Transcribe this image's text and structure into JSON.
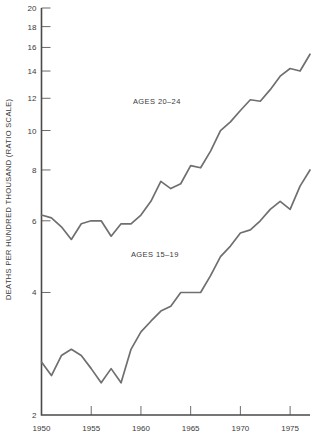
{
  "chart_data": {
    "type": "line",
    "title": "",
    "xlabel": "",
    "ylabel": "DEATHS PER HUNDRED THOUSAND (RATIO SCALE)",
    "scale": "log",
    "grid": false,
    "legend": "inline-annotations",
    "xlim": [
      1950,
      1977
    ],
    "ylim": [
      2,
      20
    ],
    "ytick_values": [
      2,
      4,
      6,
      8,
      10,
      12,
      14,
      16,
      18,
      20
    ],
    "ytick_labels": [
      "2",
      "4",
      "6",
      "8",
      "10",
      "12",
      "14",
      "16",
      "18",
      "20"
    ],
    "xtick_values": [
      1950,
      1955,
      1960,
      1965,
      1970,
      1975
    ],
    "xtick_labels": [
      "1950",
      "1955",
      "1960",
      "1965",
      "1970",
      "1975"
    ],
    "x": [
      1950,
      1951,
      1952,
      1953,
      1954,
      1955,
      1956,
      1957,
      1958,
      1959,
      1960,
      1961,
      1962,
      1963,
      1964,
      1965,
      1966,
      1967,
      1968,
      1969,
      1970,
      1971,
      1972,
      1973,
      1974,
      1975,
      1976,
      1977
    ],
    "series": [
      {
        "name": "AGES 20-24",
        "label": "AGES 20–24",
        "label_x": 1961.6,
        "label_y": 11.6,
        "values": [
          6.2,
          6.1,
          5.8,
          5.4,
          5.9,
          6.0,
          6.0,
          5.5,
          5.9,
          5.9,
          6.2,
          6.7,
          7.5,
          7.2,
          7.4,
          8.2,
          8.1,
          8.9,
          10.0,
          10.5,
          11.2,
          11.9,
          11.8,
          12.6,
          13.6,
          14.2,
          14.0,
          15.4
        ]
      },
      {
        "name": "AGES 15-19",
        "label": "AGES 15–19",
        "label_x": 1961.4,
        "label_y": 4.9,
        "values": [
          2.7,
          2.5,
          2.8,
          2.9,
          2.8,
          2.6,
          2.4,
          2.6,
          2.4,
          2.9,
          3.2,
          3.4,
          3.6,
          3.7,
          4.0,
          4.0,
          4.0,
          4.4,
          4.9,
          5.2,
          5.6,
          5.7,
          6.0,
          6.4,
          6.7,
          6.4,
          7.3,
          8.0
        ]
      }
    ]
  },
  "axes": {
    "y_axis_title": "DEATHS PER HUNDRED THOUSAND (RATIO SCALE)"
  }
}
